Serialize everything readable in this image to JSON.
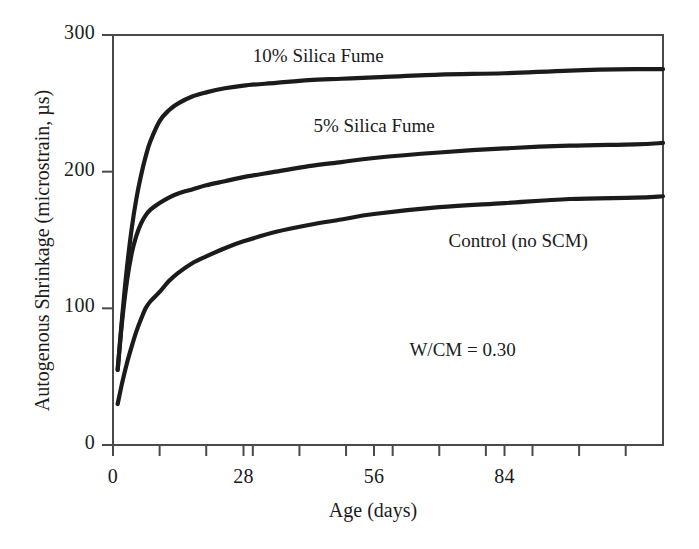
{
  "chart_data": {
    "type": "line",
    "title": "",
    "xlabel": "Age (days)",
    "ylabel": "Autogenous Shrinkage (microstrain, µs)",
    "xlim": [
      0,
      118
    ],
    "ylim": [
      0,
      300
    ],
    "xticks": [
      0,
      28,
      56,
      84
    ],
    "xtick_labels": [
      "0",
      "28",
      "56",
      "84"
    ],
    "minor_xtick_interval": 10,
    "yticks": [
      0,
      100,
      200,
      300
    ],
    "ytick_labels": [
      "0",
      "100",
      "200",
      "300"
    ],
    "grid": false,
    "legend": "inline-annotations",
    "annotations": [
      {
        "text": "W/CM = 0.30",
        "x": 75,
        "y": 68
      }
    ],
    "series": [
      {
        "name": "10% Silica Fume",
        "label_x": 30,
        "label_y": 283,
        "color": "#1b1b1b",
        "x": [
          1,
          2,
          3,
          4,
          5,
          6,
          7,
          8,
          10,
          12,
          14,
          17,
          20,
          24,
          28,
          35,
          42,
          49,
          56,
          70,
          84,
          98,
          112,
          118
        ],
        "y": [
          55,
          95,
          130,
          158,
          180,
          197,
          211,
          222,
          237,
          245,
          250,
          255,
          258,
          261,
          263,
          265,
          267,
          268,
          269,
          271,
          272,
          274,
          275,
          275
        ]
      },
      {
        "name": "5% Silica Fume",
        "label_x": 43,
        "label_y": 232,
        "color": "#1b1b1b",
        "x": [
          1,
          2,
          3,
          4,
          5,
          6,
          7,
          8,
          10,
          12,
          14,
          17,
          20,
          24,
          28,
          35,
          42,
          49,
          56,
          70,
          84,
          98,
          112,
          118
        ],
        "y": [
          55,
          92,
          120,
          140,
          153,
          162,
          168,
          172,
          177,
          181,
          184,
          187,
          190,
          193,
          196,
          200,
          204,
          207,
          210,
          214,
          217,
          219,
          220,
          221
        ]
      },
      {
        "name": "Control (no SCM)",
        "label_x": 72,
        "label_y": 148,
        "color": "#1b1b1b",
        "x": [
          1,
          2,
          3,
          4,
          5,
          6,
          7,
          8,
          10,
          12,
          14,
          17,
          20,
          24,
          28,
          35,
          42,
          49,
          56,
          70,
          84,
          98,
          112,
          118
        ],
        "y": [
          30,
          46,
          60,
          72,
          83,
          92,
          100,
          105,
          112,
          120,
          126,
          133,
          138,
          144,
          149,
          156,
          161,
          165,
          169,
          174,
          177,
          180,
          181,
          182
        ]
      }
    ]
  },
  "axes": {
    "x_title": "Age (days)",
    "y_title": "Autogenous Shrinkage (microstrain, µs)",
    "x_tick_labels": [
      "0",
      "28",
      "56",
      "84"
    ],
    "y_tick_labels": [
      "0",
      "100",
      "200",
      "300"
    ]
  },
  "labels": {
    "series_10": "10% Silica Fume",
    "series_5": "5% Silica Fume",
    "series_control": "Control (no SCM)",
    "wcm_note": "W/CM = 0.30"
  },
  "style": {
    "line_color": "#1b1b1b",
    "axis_color": "#4a4a4a",
    "background": "#ffffff"
  }
}
